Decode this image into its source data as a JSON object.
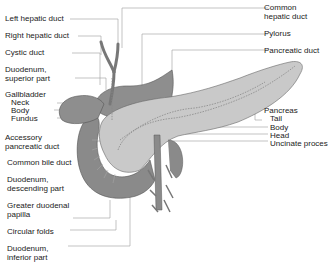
{
  "figure": {
    "colors": {
      "duodenum": "#8a8a8a",
      "gallbladder": "#8e8e8e",
      "pancreas": "#c9c9c9",
      "duct": "#9a9a9a",
      "leader": "#999999",
      "text": "#222222"
    }
  },
  "labels_left": [
    {
      "text": "Left hepatic duct"
    },
    {
      "text": "Right hepatic duct"
    },
    {
      "text": "Cystic duct"
    },
    {
      "text": "Duodenum,"
    },
    {
      "text": "superior part"
    },
    {
      "text": "Gallbladder"
    },
    {
      "text": "Neck"
    },
    {
      "text": "Body"
    },
    {
      "text": "Fundus"
    },
    {
      "text": "Accessory"
    },
    {
      "text": "pancreatic duct"
    },
    {
      "text": "Common bile duct"
    },
    {
      "text": "Duodenum,"
    },
    {
      "text": "descending part"
    },
    {
      "text": "Greater duodenal"
    },
    {
      "text": "papilla"
    },
    {
      "text": "Circular folds"
    },
    {
      "text": "Duodenum,"
    },
    {
      "text": "inferior part"
    }
  ],
  "labels_right": [
    {
      "text": "Common"
    },
    {
      "text": "hepatic duct"
    },
    {
      "text": "Pylorus"
    },
    {
      "text": "Pancreatic duct"
    },
    {
      "text": "Pancreas"
    },
    {
      "text": "Tail"
    },
    {
      "text": "Body"
    },
    {
      "text": "Head"
    },
    {
      "text": "Uncinate proces"
    }
  ]
}
